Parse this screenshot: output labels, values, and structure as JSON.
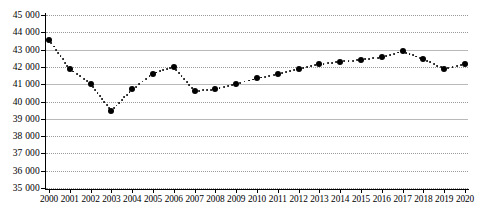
{
  "chart_data": {
    "type": "line",
    "title": "",
    "subtitle": "",
    "xlabel": "",
    "ylabel": "",
    "grid": true,
    "legend": false,
    "marker_style": "dotted-line-with-round-markers",
    "ylim": [
      35000,
      45000
    ],
    "ytick_step": 1000,
    "ytick_labels": [
      "45 000",
      "44 000",
      "43 000",
      "42 000",
      "41 000",
      "40 000",
      "39 000",
      "38 000",
      "37 000",
      "36 000",
      "35 000"
    ],
    "ytick_values": [
      45000,
      44000,
      43000,
      42000,
      41000,
      40000,
      39000,
      38000,
      37000,
      36000,
      35000
    ],
    "categories": [
      "2000",
      "2001",
      "2002",
      "2003",
      "2004",
      "2005",
      "2006",
      "2007",
      "2008",
      "2009",
      "2010",
      "2011",
      "2012",
      "2013",
      "2014",
      "2015",
      "2016",
      "2017",
      "2018",
      "2019",
      "2020"
    ],
    "x": [
      2000,
      2001,
      2002,
      2003,
      2004,
      2005,
      2006,
      2007,
      2008,
      2009,
      2010,
      2011,
      2012,
      2013,
      2014,
      2015,
      2016,
      2017,
      2018,
      2019,
      2020
    ],
    "values": [
      43550,
      41870,
      41030,
      39450,
      40700,
      41600,
      42020,
      40600,
      40700,
      41030,
      41330,
      41600,
      41880,
      42150,
      42300,
      42400,
      42550,
      42900,
      42450,
      41870,
      42150
    ],
    "series": [
      {
        "name": "",
        "values": [
          43550,
          41870,
          41030,
          39450,
          40700,
          41600,
          42020,
          40600,
          40700,
          41030,
          41330,
          41600,
          41880,
          42150,
          42300,
          42400,
          42550,
          42900,
          42450,
          41870,
          42150
        ]
      }
    ],
    "annotations": []
  },
  "caption": {
    "text": ""
  }
}
